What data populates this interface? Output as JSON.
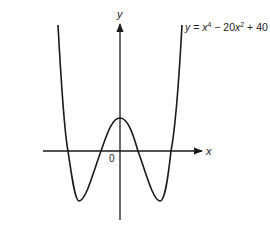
{
  "figure": {
    "equation_label": {
      "y": "y",
      "eq": " = ",
      "x1": "x",
      "exp1": "4",
      "mid": " − 20",
      "x2": "x",
      "exp2": "2",
      "tail": " + 40"
    },
    "axes": {
      "x_label": "x",
      "y_label": "y",
      "origin_label": "0"
    },
    "function": "y = x^4 - 20x^2 + 40",
    "colors": {
      "curve": "#1a1a1a",
      "axes": "#1a1a1a",
      "background": "#ffffff"
    }
  }
}
